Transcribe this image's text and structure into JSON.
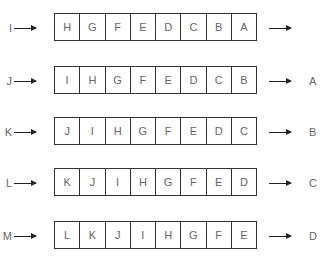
{
  "diagram": {
    "title": "",
    "rows": [
      {
        "input": "I",
        "cells": [
          "H",
          "G",
          "F",
          "E",
          "D",
          "C",
          "B",
          "A"
        ],
        "output": ""
      },
      {
        "input": "J",
        "cells": [
          "I",
          "H",
          "G",
          "F",
          "E",
          "D",
          "C",
          "B"
        ],
        "output": "A"
      },
      {
        "input": "K",
        "cells": [
          "J",
          "I",
          "H",
          "G",
          "F",
          "E",
          "D",
          "C"
        ],
        "output": "B"
      },
      {
        "input": "L",
        "cells": [
          "K",
          "J",
          "I",
          "H",
          "G",
          "F",
          "E",
          "D"
        ],
        "output": "C"
      },
      {
        "input": "M",
        "cells": [
          "L",
          "K",
          "J",
          "I",
          "H",
          "G",
          "F",
          "E"
        ],
        "output": "D"
      }
    ]
  }
}
